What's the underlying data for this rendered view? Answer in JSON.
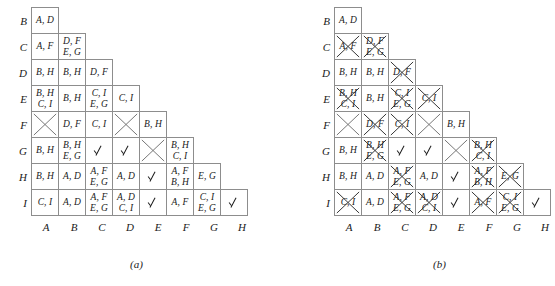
{
  "figure": {
    "panels": [
      {
        "id": "a",
        "caption": "(a)",
        "row_labels": [
          "B",
          "C",
          "D",
          "E",
          "F",
          "G",
          "H",
          "I"
        ],
        "col_labels": [
          "A",
          "B",
          "C",
          "D",
          "E",
          "F",
          "G",
          "H"
        ],
        "rows": [
          [
            {
              "lines": [
                "A, D"
              ],
              "crossed": false
            }
          ],
          [
            {
              "lines": [
                "A, F"
              ],
              "crossed": false
            },
            {
              "lines": [
                "D, F",
                "E, G"
              ],
              "crossed": false
            }
          ],
          [
            {
              "lines": [
                "B, H"
              ],
              "crossed": false
            },
            {
              "lines": [
                "B, H"
              ],
              "crossed": false
            },
            {
              "lines": [
                "D, F"
              ],
              "crossed": false
            }
          ],
          [
            {
              "lines": [
                "B, H",
                "C, I"
              ],
              "crossed": false
            },
            {
              "lines": [
                "B, H"
              ],
              "crossed": false
            },
            {
              "lines": [
                "C, I",
                "E, G"
              ],
              "crossed": false
            },
            {
              "lines": [
                "C, I"
              ],
              "crossed": false
            }
          ],
          [
            {
              "lines": [],
              "empty_cross": true
            },
            {
              "lines": [
                "D, F"
              ],
              "crossed": false
            },
            {
              "lines": [
                "C, I"
              ],
              "crossed": false
            },
            {
              "lines": [],
              "empty_cross": true
            },
            {
              "lines": [
                "B, H"
              ],
              "crossed": false
            }
          ],
          [
            {
              "lines": [
                "B, H"
              ],
              "crossed": false
            },
            {
              "lines": [
                "B, H",
                "E, G"
              ],
              "crossed": false
            },
            {
              "check": true
            },
            {
              "check": true
            },
            {
              "lines": [],
              "empty_cross": true
            },
            {
              "lines": [
                "B, H",
                "C, I"
              ],
              "crossed": false
            }
          ],
          [
            {
              "lines": [
                "B, H"
              ],
              "crossed": false
            },
            {
              "lines": [
                "A, D"
              ],
              "crossed": false
            },
            {
              "lines": [
                "A, F",
                "E, G"
              ],
              "crossed": false
            },
            {
              "lines": [
                "A, D"
              ],
              "crossed": false
            },
            {
              "check": true
            },
            {
              "lines": [
                "A, F",
                "B, H"
              ],
              "crossed": false
            },
            {
              "lines": [
                "E, G"
              ],
              "crossed": false
            }
          ],
          [
            {
              "lines": [
                "C, I"
              ],
              "crossed": false
            },
            {
              "lines": [
                "A, D"
              ],
              "crossed": false
            },
            {
              "lines": [
                "A, F",
                "E, G"
              ],
              "crossed": false
            },
            {
              "lines": [
                "A, D",
                "C, I"
              ],
              "crossed": false
            },
            {
              "check": true
            },
            {
              "lines": [
                "A, F"
              ],
              "crossed": false
            },
            {
              "lines": [
                "C, I",
                "E, G"
              ],
              "crossed": false
            },
            {
              "check": true
            }
          ]
        ]
      },
      {
        "id": "b",
        "caption": "(b)",
        "row_labels": [
          "B",
          "C",
          "D",
          "E",
          "F",
          "G",
          "H",
          "I"
        ],
        "col_labels": [
          "A",
          "B",
          "C",
          "D",
          "E",
          "F",
          "G",
          "H"
        ],
        "rows": [
          [
            {
              "lines": [
                "A, D"
              ],
              "crossed": false
            }
          ],
          [
            {
              "lines": [
                "A, F"
              ],
              "crossed": true
            },
            {
              "lines": [
                "D, F",
                "E, G"
              ],
              "crossed": true
            }
          ],
          [
            {
              "lines": [
                "B, H"
              ],
              "crossed": false
            },
            {
              "lines": [
                "B, H"
              ],
              "crossed": false
            },
            {
              "lines": [
                "D, F"
              ],
              "crossed": true
            }
          ],
          [
            {
              "lines": [
                "B, H",
                "C, I"
              ],
              "crossed": true
            },
            {
              "lines": [
                "B, H"
              ],
              "crossed": false
            },
            {
              "lines": [
                "C, I",
                "E, G"
              ],
              "crossed": true
            },
            {
              "lines": [
                "C, I"
              ],
              "crossed": true
            }
          ],
          [
            {
              "lines": [],
              "empty_cross": true
            },
            {
              "lines": [
                "D, F"
              ],
              "crossed": true
            },
            {
              "lines": [
                "C, I"
              ],
              "crossed": true
            },
            {
              "lines": [],
              "empty_cross": true
            },
            {
              "lines": [
                "B, H"
              ],
              "crossed": false
            }
          ],
          [
            {
              "lines": [
                "B, H"
              ],
              "crossed": false
            },
            {
              "lines": [
                "B, H",
                "E, G"
              ],
              "crossed": true
            },
            {
              "check": true
            },
            {
              "check": true
            },
            {
              "lines": [],
              "empty_cross": true
            },
            {
              "lines": [
                "B, H",
                "C, I"
              ],
              "crossed": true
            }
          ],
          [
            {
              "lines": [
                "B, H"
              ],
              "crossed": false
            },
            {
              "lines": [
                "A, D"
              ],
              "crossed": false
            },
            {
              "lines": [
                "A, F",
                "E, G"
              ],
              "crossed": true
            },
            {
              "lines": [
                "A, D"
              ],
              "crossed": false
            },
            {
              "check": true
            },
            {
              "lines": [
                "A, F",
                "B, H"
              ],
              "crossed": true
            },
            {
              "lines": [
                "E, G"
              ],
              "crossed": true
            }
          ],
          [
            {
              "lines": [
                "C, I"
              ],
              "crossed": true
            },
            {
              "lines": [
                "A, D"
              ],
              "crossed": false
            },
            {
              "lines": [
                "A, F",
                "E, G"
              ],
              "crossed": true
            },
            {
              "lines": [
                "A, D",
                "C, I"
              ],
              "crossed": true
            },
            {
              "check": true
            },
            {
              "lines": [
                "A, F"
              ],
              "crossed": true
            },
            {
              "lines": [
                "C, I",
                "E, G"
              ],
              "crossed": true
            },
            {
              "check": true
            }
          ]
        ]
      }
    ]
  }
}
